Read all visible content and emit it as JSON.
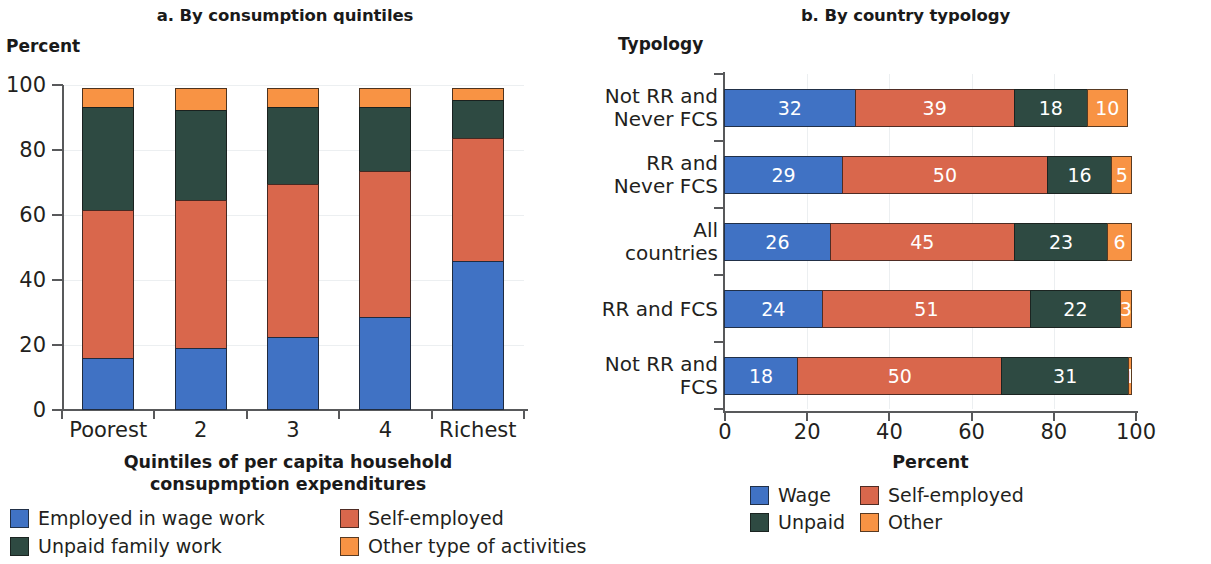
{
  "colors": {
    "wage": "#4072c4",
    "self_employed": "#d9674c",
    "unpaid": "#2e4a42",
    "other": "#f89344",
    "axis": "#58595b",
    "grid": "#eceff1",
    "text": "#231f20"
  },
  "panel_a": {
    "title": "a. By consumption quintiles",
    "y_axis_name": "Percent",
    "x_axis_title_line1": "Quintiles of per capita household",
    "x_axis_title_line2": "consupmption expenditures",
    "y_ticks": [
      "0",
      "20",
      "40",
      "60",
      "80",
      "100"
    ],
    "categories": [
      "Poorest",
      "2",
      "3",
      "4",
      "Richest"
    ],
    "legend": [
      {
        "label": "Employed in wage work",
        "color_key": "wage"
      },
      {
        "label": "Self-employed",
        "color_key": "self_employed"
      },
      {
        "label": "Unpaid family work",
        "color_key": "unpaid"
      },
      {
        "label": "Other type of activities",
        "color_key": "other"
      }
    ]
  },
  "panel_b": {
    "title": "b. By country typology",
    "y_axis_name": "Typology",
    "x_axis_title": "Percent",
    "x_ticks": [
      "0",
      "20",
      "40",
      "60",
      "80",
      "100"
    ],
    "categories": [
      "Not RR and\nNever FCS",
      "RR and\nNever FCS",
      "All countries",
      "RR and FCS",
      "Not RR and\nFCS"
    ],
    "legend": [
      {
        "label": "Wage",
        "color_key": "wage"
      },
      {
        "label": "Self-employed",
        "color_key": "self_employed"
      },
      {
        "label": "Unpaid",
        "color_key": "unpaid"
      },
      {
        "label": "Other",
        "color_key": "other"
      }
    ]
  },
  "chart_data": [
    {
      "type": "bar",
      "id": "panel_a",
      "orientation": "vertical",
      "stacked": true,
      "title": "a. By consumption quintiles",
      "xlabel": "Quintiles of per capita household consupmption expenditures",
      "ylabel": "Percent",
      "ylim": [
        0,
        100
      ],
      "yticks": [
        0,
        20,
        40,
        60,
        80,
        100
      ],
      "grid": true,
      "legend_position": "bottom",
      "categories": [
        "Poorest",
        "2",
        "3",
        "4",
        "Richest"
      ],
      "series": [
        {
          "name": "Employed in wage work",
          "color": "#4072c4",
          "values": [
            16,
            19,
            22.5,
            28.5,
            46
          ]
        },
        {
          "name": "Self-employed",
          "color": "#d9674c",
          "values": [
            46,
            46,
            47.5,
            45.5,
            38
          ]
        },
        {
          "name": "Unpaid family work",
          "color": "#2e4a42",
          "values": [
            32,
            28,
            24,
            20,
            12
          ]
        },
        {
          "name": "Other type of activities",
          "color": "#f89344",
          "values": [
            6,
            7,
            6,
            6,
            4
          ]
        }
      ]
    },
    {
      "type": "bar",
      "id": "panel_b",
      "orientation": "horizontal",
      "stacked": true,
      "title": "b. By country typology",
      "xlabel": "Percent",
      "ylabel": "Typology",
      "xlim": [
        0,
        100
      ],
      "xticks": [
        0,
        20,
        40,
        60,
        80,
        100
      ],
      "grid": true,
      "legend_position": "bottom",
      "data_labels": true,
      "categories": [
        "Not RR and Never FCS",
        "RR and Never FCS",
        "All countries",
        "RR and FCS",
        "Not RR and FCS"
      ],
      "series": [
        {
          "name": "Wage",
          "color": "#4072c4",
          "values": [
            32,
            29,
            26,
            24,
            18
          ]
        },
        {
          "name": "Self-employed",
          "color": "#d9674c",
          "values": [
            39,
            50,
            45,
            51,
            50
          ]
        },
        {
          "name": "Unpaid",
          "color": "#2e4a42",
          "values": [
            18,
            16,
            23,
            22,
            31
          ]
        },
        {
          "name": "Other",
          "color": "#f89344",
          "values": [
            10,
            5,
            6,
            3,
            1
          ]
        }
      ]
    }
  ]
}
